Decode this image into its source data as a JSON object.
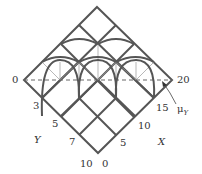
{
  "diagram": {
    "colors": {
      "thick": "#555555",
      "thin": "#999999",
      "dashed": "#666666",
      "text": "#333333"
    },
    "labels": {
      "left_end": "0",
      "right_end": "20",
      "y_ticks": [
        "3",
        "5",
        "7",
        "10"
      ],
      "x_ticks": [
        "0",
        "5",
        "10",
        "15"
      ],
      "y_axis": "Y",
      "x_axis": "X",
      "mu": "μ",
      "mu_sub": "Y"
    }
  }
}
